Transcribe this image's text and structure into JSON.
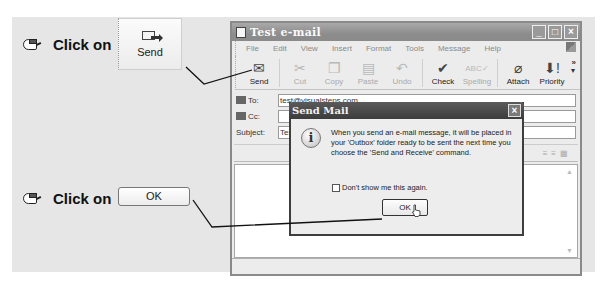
{
  "instructions": {
    "step1": {
      "text": "Click on",
      "target_label": "Send"
    },
    "step2": {
      "text": "Click on",
      "target_label": "OK"
    }
  },
  "window": {
    "title": "Test e-mail",
    "controls": {
      "minimize": "_",
      "maximize": "□",
      "close": "×"
    },
    "menu": [
      "File",
      "Edit",
      "View",
      "Insert",
      "Format",
      "Tools",
      "Message",
      "Help"
    ],
    "toolbar": [
      {
        "label": "Send",
        "icon": "send-icon",
        "glyph": "✉",
        "enabled": true
      },
      {
        "label": "Cut",
        "icon": "scissors-icon",
        "glyph": "✂",
        "enabled": false
      },
      {
        "label": "Copy",
        "icon": "copy-icon",
        "glyph": "❐",
        "enabled": false
      },
      {
        "label": "Paste",
        "icon": "paste-icon",
        "glyph": "📋",
        "enabled": false
      },
      {
        "label": "Undo",
        "icon": "undo-icon",
        "glyph": "↶",
        "enabled": true
      },
      {
        "label": "Check",
        "icon": "check-names-icon",
        "glyph": "✔",
        "enabled": true
      },
      {
        "label": "Spelling",
        "icon": "spelling-icon",
        "glyph": "ᴬᴮᶜ",
        "enabled": false
      },
      {
        "label": "Attach",
        "icon": "paperclip-icon",
        "glyph": "📎",
        "enabled": true
      },
      {
        "label": "Priority",
        "icon": "priority-icon",
        "glyph": "⬇!",
        "enabled": true
      }
    ],
    "toolbar_overflow": "»",
    "headers": {
      "to_label": "To:",
      "to_value": "test@visualsteps.com",
      "cc_label": "Cc:",
      "cc_value": "",
      "subject_label": "Subject:",
      "subject_value": "Test e-mail"
    }
  },
  "dialog": {
    "title": "Send Mail",
    "close": "×",
    "message": "When you send an e-mail message, it will be placed in your 'Outbox' folder ready to be sent the next time you choose the 'Send and Receive' command.",
    "checkbox_label": "Don't show me this again.",
    "checkbox_checked": false,
    "ok_label": "OK"
  },
  "colors": {
    "panel_bg": "#e6e6e6",
    "title_bar": "#8d8d8d",
    "dialog_title": "#3c3c3c"
  }
}
